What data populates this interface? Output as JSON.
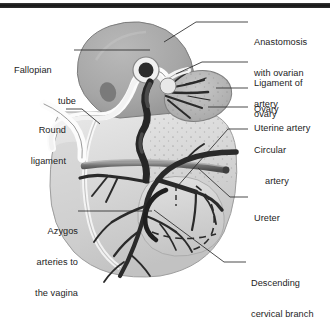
{
  "figure": {
    "style": "grayscale anatomical illustration",
    "top_scan_bar_color": "#1c1c1c",
    "background_color": "#ffffff",
    "ink_color": "#1d1d1d"
  },
  "labels": [
    {
      "id": "fallopian-tube",
      "lines": [
        "Fallopian",
        "tube"
      ],
      "align": "left",
      "side": "left",
      "x": 14,
      "y": 44,
      "leader": {
        "from": [
          74,
          50
        ],
        "to": [
          150,
          50
        ]
      }
    },
    {
      "id": "round-ligament",
      "lines": [
        "Round",
        "ligament"
      ],
      "align": "right",
      "side": "left",
      "x": 12,
      "y": 104,
      "leader": {
        "from": [
          66,
          109
        ],
        "to": [
          96,
          122
        ]
      }
    },
    {
      "id": "azygos-arteries-to-the-vagina",
      "lines": [
        "Azygos",
        "arteries to",
        "the vagina"
      ],
      "align": "right",
      "side": "left",
      "x": 10,
      "y": 205,
      "leader": {
        "from": [
          78,
          211
        ],
        "to": [
          152,
          211
        ]
      }
    },
    {
      "id": "anastomosis-with-ovarian-artery",
      "lines": [
        "Anastomosis",
        "with ovarian",
        "artery"
      ],
      "align": "left",
      "side": "right",
      "x": 254,
      "y": 16,
      "leader": {
        "from": [
          248,
          22
        ],
        "to": [
          196,
          22
        ],
        "elbow": [
          166,
          40
        ]
      }
    },
    {
      "id": "ligament-of-ovary",
      "lines": [
        "Ligament of",
        "ovary"
      ],
      "align": "left",
      "side": "right",
      "x": 254,
      "y": 57,
      "leader": {
        "from": [
          248,
          62
        ],
        "to": [
          200,
          62
        ],
        "elbow": [
          176,
          72
        ]
      }
    },
    {
      "id": "ovary",
      "lines": [
        "Ovary"
      ],
      "align": "left",
      "side": "right",
      "x": 254,
      "y": 83,
      "leader": {
        "from": [
          248,
          88
        ],
        "to": [
          214,
          88
        ]
      }
    },
    {
      "id": "uterine-artery",
      "lines": [
        "Uterine artery"
      ],
      "align": "left",
      "side": "right",
      "x": 254,
      "y": 102,
      "leader": {
        "from": [
          248,
          107
        ],
        "to": [
          206,
          107
        ]
      }
    },
    {
      "id": "circular-artery",
      "lines": [
        "Circular",
        "artery"
      ],
      "align": "left",
      "side": "right",
      "x": 254,
      "y": 124,
      "leader": {
        "from": [
          248,
          129
        ],
        "to": [
          226,
          129
        ],
        "elbow": [
          176,
          186
        ]
      }
    },
    {
      "id": "ureter",
      "lines": [
        "Ureter"
      ],
      "align": "left",
      "side": "right",
      "x": 254,
      "y": 192,
      "leader": {
        "from": [
          248,
          197
        ],
        "to": [
          228,
          197
        ],
        "elbow": [
          196,
          168
        ]
      }
    },
    {
      "id": "descending-cervical-branch",
      "lines": [
        "Descending",
        "cervical branch"
      ],
      "align": "left",
      "side": "right",
      "x": 251,
      "y": 257,
      "leader": {
        "from": [
          246,
          262
        ],
        "to": [
          222,
          262
        ],
        "elbow": [
          152,
          208
        ]
      }
    }
  ]
}
